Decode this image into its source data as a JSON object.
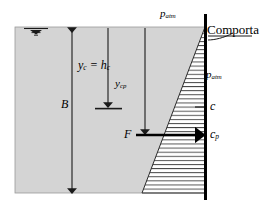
{
  "figure": {
    "colors": {
      "fluid_fill": "#d4d4d4",
      "fluid_stroke": "#8a8a8a",
      "line": "#1a1a1a",
      "gate": "#000000",
      "hatch": "#2b2b2b",
      "background": "#ffffff"
    }
  },
  "labels": {
    "p_atm_top": {
      "text": "p",
      "sub": "atm"
    },
    "p_atm_right": {
      "text": "p",
      "sub": "atm"
    },
    "comporta": "Comporta",
    "y_c_eq_h_c": {
      "text": "y",
      "sub": "c",
      "middle": " = ",
      "text2": "h",
      "sub2": "c"
    },
    "y_cp": {
      "text": "y",
      "sub": "cp"
    },
    "B": "B",
    "F": "F",
    "c": "c",
    "c_p": {
      "text": "c",
      "sub": "p"
    }
  },
  "geometry": {
    "fluid_region": {
      "x": 15,
      "y": 27,
      "width": 190,
      "height": 166
    },
    "gate_line": {
      "x": 205,
      "y_top": 14,
      "y_bottom": 200
    },
    "pressure_triangle": {
      "apex_x": 205,
      "apex_y": 27,
      "base_x": 142,
      "base_y": 193
    },
    "water_surface_symbol": {
      "x": 24,
      "y": 27
    },
    "B_arrow": {
      "x": 72,
      "y_top": 28,
      "y_bottom": 193
    },
    "y_c_arrow": {
      "x": 108,
      "y_top": 28,
      "y_bottom": 108
    },
    "centroid_tick": {
      "x1": 95,
      "x2": 122,
      "y": 108
    },
    "y_cp_arrow": {
      "x": 145,
      "y_top": 28,
      "y_bottom": 135
    },
    "F_arrow": {
      "x_start": 135,
      "x_end": 200,
      "y": 135
    },
    "c_tick": {
      "x1": 196,
      "x2": 208,
      "y": 107
    },
    "comporta_leader": {
      "from_x": 208,
      "from_y": 37,
      "to_x": 232,
      "to_y": 33
    }
  }
}
